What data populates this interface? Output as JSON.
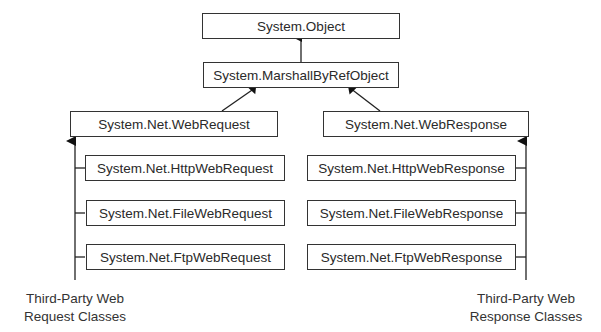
{
  "diagram": {
    "type": "class-hierarchy",
    "root": {
      "label": "System.Object"
    },
    "level1": {
      "label": "System.MarshallByRefObject"
    },
    "request_base": {
      "label": "System.Net.WebRequest"
    },
    "response_base": {
      "label": "System.Net.WebResponse"
    },
    "request_classes": [
      {
        "label": "System.Net.HttpWebRequest"
      },
      {
        "label": "System.Net.FileWebRequest"
      },
      {
        "label": "System.Net.FtpWebRequest"
      }
    ],
    "response_classes": [
      {
        "label": "System.Net.HttpWebResponse"
      },
      {
        "label": "System.Net.FileWebResponse"
      },
      {
        "label": "System.Net.FtpWebResponse"
      }
    ],
    "third_party_request": {
      "line1": "Third-Party Web",
      "line2": "Request Classes"
    },
    "third_party_response": {
      "line1": "Third-Party Web",
      "line2": "Response Classes"
    }
  }
}
